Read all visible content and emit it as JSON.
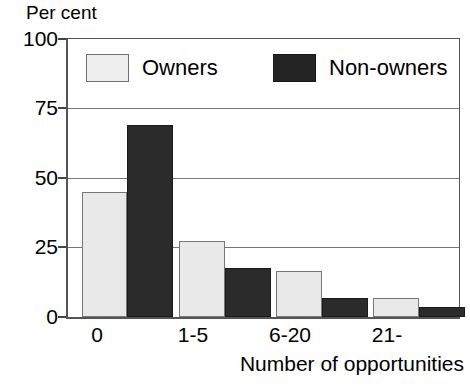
{
  "chart_data": {
    "type": "bar",
    "title": "",
    "xlabel": "Number of opportunities",
    "ylabel": "Per cent",
    "categories": [
      "0",
      "1-5",
      "6-20",
      "21-"
    ],
    "series": [
      {
        "name": "Owners",
        "color": "#e9e9e9",
        "values": [
          45,
          27.5,
          16.5,
          7
        ]
      },
      {
        "name": "Non-owners",
        "color": "#2b2b2b",
        "values": [
          69,
          17.5,
          7,
          3.5
        ]
      }
    ],
    "ylim": [
      0,
      100
    ],
    "yticks": [
      0,
      25,
      50,
      75,
      100
    ],
    "ytick_labels": [
      "0",
      "25",
      "50",
      "75",
      "100"
    ],
    "grid": true,
    "legend_position": "upper-left-inside"
  },
  "axes": {
    "y_axis_title": "Per cent",
    "x_axis_title": "Number of opportunities",
    "y_tick_labels": [
      "100",
      "75",
      "50",
      "25",
      "0"
    ],
    "x_tick_labels": [
      "0",
      "1-5",
      "6-20",
      "21-"
    ]
  },
  "legend": {
    "entries": [
      {
        "label": "Owners"
      },
      {
        "label": "Non-owners"
      }
    ]
  }
}
